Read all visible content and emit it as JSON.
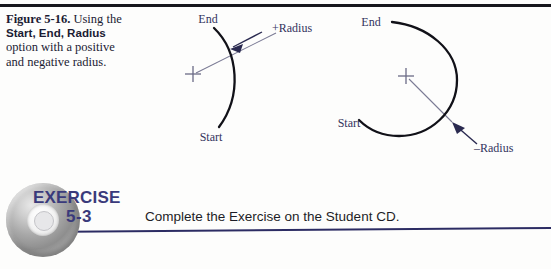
{
  "page": {
    "width": 551,
    "height": 269,
    "background": "#fdfdfc",
    "rule_color": "#16161c"
  },
  "caption": {
    "figure_number": "Figure 5-16.",
    "text_part1": "Using the ",
    "bold_part1": "Start, End,",
    "bold_part2": "Radius",
    "text_part2": " option with",
    "text_part3": "a positive and",
    "text_part4": "negative radius.",
    "color": "#1b1b33"
  },
  "diagrams": {
    "label_color": "#33335c",
    "arc_color": "#111118",
    "radius_line_color": "#6b6b86",
    "left": {
      "name": "positive-radius-arc",
      "end_label": "End",
      "start_label": "Start",
      "radius_label": "+Radius",
      "center_marker": "crosshair"
    },
    "right": {
      "name": "negative-radius-arc",
      "end_label": "End",
      "start_label": "Start",
      "radius_label": "–Radius",
      "center_marker": "crosshair"
    }
  },
  "exercise": {
    "icon_name": "cd-rom-icon",
    "heading": "EXERCISE",
    "number": "5-3",
    "instruction": "Complete the Exercise on the Student CD.",
    "accent_color": "#3a3a7b",
    "rule_color": "#2c2c63"
  }
}
